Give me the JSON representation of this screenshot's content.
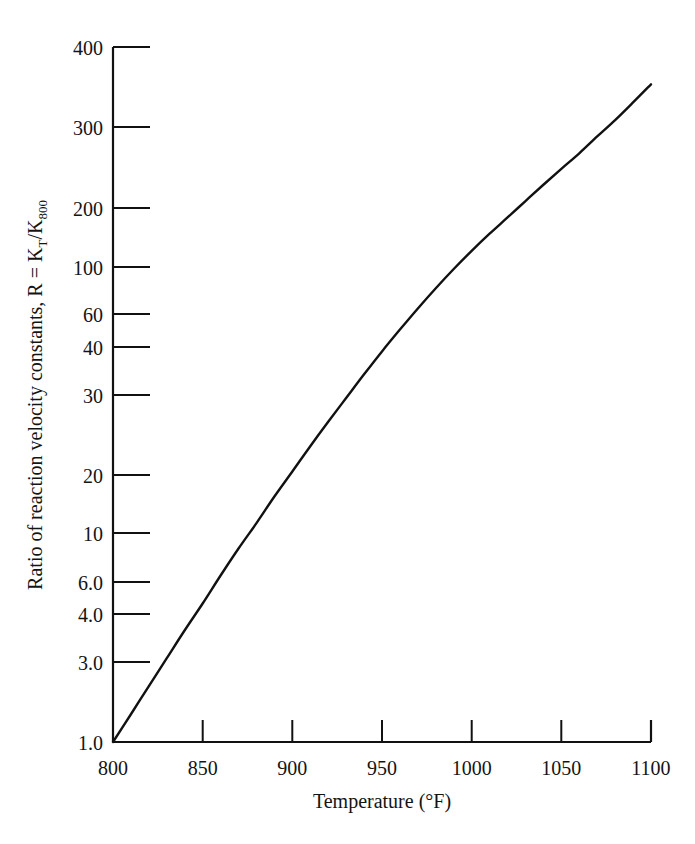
{
  "chart_data": {
    "type": "line",
    "title": "",
    "xlabel": "Temperature (°F)",
    "ylabel": "Ratio of reaction velocity constants, R = K_T/K_800",
    "ylabel_parts": {
      "lead": "Ratio of reaction velocity constants, R = K",
      "sub1": "T",
      "slash": "/K",
      "sub2": "800"
    },
    "xscale": "linear",
    "yscale": "log",
    "xlim": [
      800,
      1100
    ],
    "ylim": [
      1.0,
      400
    ],
    "grid": false,
    "legend": null,
    "xticks": [
      800,
      850,
      900,
      950,
      1000,
      1050,
      1100
    ],
    "xtick_labels": [
      "800",
      "850",
      "900",
      "950",
      "1000",
      "1050",
      "1100"
    ],
    "yticks": [
      1.0,
      2.0,
      3.0,
      4.0,
      6.0,
      10,
      20,
      30,
      40,
      60,
      100,
      200,
      300,
      400
    ],
    "ytick_labels": [
      "1.0",
      "2.0",
      "3.0",
      "4.0",
      "6.0",
      "10",
      "20",
      "30",
      "40",
      "60",
      "100",
      "200",
      "300",
      "400"
    ],
    "series": [
      {
        "name": "R",
        "color": "#111111",
        "x": [
          800,
          810,
          820,
          830,
          840,
          850,
          860,
          870,
          880,
          890,
          900,
          910,
          920,
          930,
          940,
          950,
          960,
          970,
          980,
          990,
          1000,
          1010,
          1020,
          1030,
          1040,
          1050,
          1060,
          1070,
          1080,
          1090,
          1100
        ],
        "y": [
          1.0,
          1.27,
          1.62,
          2.06,
          2.62,
          3.3,
          4.2,
          5.3,
          6.6,
          8.3,
          10.3,
          12.8,
          15.8,
          19.4,
          23.8,
          29.0,
          35.0,
          42.0,
          50.0,
          59.0,
          69.0,
          80.0,
          92.0,
          106.0,
          122.0,
          140.0,
          160.0,
          185.0,
          213.0,
          248.0,
          290.0
        ]
      }
    ]
  },
  "axis": {
    "x_tick_direction": "inward",
    "y_tick_direction": "inward",
    "spine_color": "#111111"
  }
}
